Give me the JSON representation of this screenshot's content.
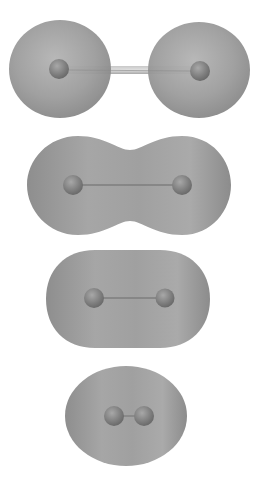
{
  "figure": {
    "background": "#ffffff",
    "surface_color": "#9a9a9a",
    "atom_color": "#7a7a7a",
    "bond_color": "#b8b8b8",
    "panels": [
      {
        "id": "separated",
        "shape": "two-spheres",
        "atoms": [
          [
            59,
            70
          ],
          [
            200,
            71
          ]
        ],
        "bond": "long"
      },
      {
        "id": "merging",
        "shape": "peanut",
        "atoms": [
          [
            73,
            185
          ],
          [
            182,
            185
          ]
        ],
        "bond": "medium"
      },
      {
        "id": "capsule",
        "shape": "capsule",
        "atoms": [
          [
            94,
            298
          ],
          [
            165,
            298
          ]
        ],
        "bond": "short"
      },
      {
        "id": "compact",
        "shape": "oval",
        "atoms": [
          [
            115,
            416
          ],
          [
            144,
            416
          ]
        ],
        "bond": "very-short"
      }
    ]
  }
}
